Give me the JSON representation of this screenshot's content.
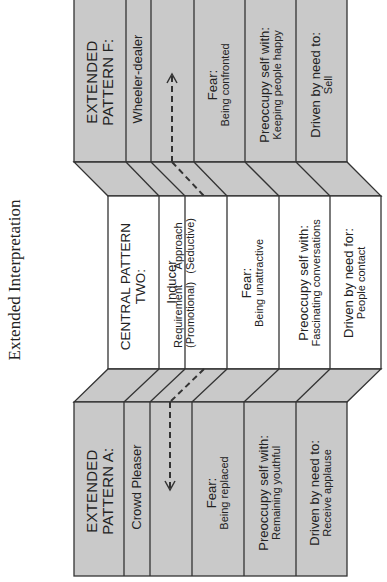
{
  "title": "Extended Interpretation",
  "colors": {
    "gray_fill": "#c9c9c9",
    "center_fill": "#ffffff",
    "line": "#333333"
  },
  "top_pattern": {
    "header": "EXTENDED\nPATTERN F:",
    "header_l1": "EXTENDED",
    "header_l2": "PATTERN F:",
    "name": "Wheeler-dealer",
    "arrow": "dashed-arrow-up",
    "fear_label": "Fear:",
    "fear": "Being confronted",
    "preoccupy_label": "Preoccupy self with:",
    "preoccupy": "Keeping people happy",
    "driven_label": "Driven by need to:",
    "driven": "Sell"
  },
  "center_pattern": {
    "header_l1": "CENTRAL PATTERN",
    "header_l2": "TWO:",
    "name": "Inducer",
    "requirement_label": "Requirement",
    "requirement": "(Promotional)",
    "approach_label": "Approach",
    "approach": "(Seductive)",
    "fear_label": "Fear:",
    "fear": "Being unattractive",
    "preoccupy_label": "Preoccupy self with:",
    "preoccupy": "Fascinating conversations",
    "driven_label": "Driven by need for:",
    "driven": "People contact"
  },
  "bottom_pattern": {
    "header_l1": "EXTENDED",
    "header_l2": "PATTERN  A:",
    "name": "Crowd Pleaser",
    "arrow": "dashed-arrow-down",
    "fear_label": "Fear:",
    "fear": "Being replaced",
    "preoccupy_label": "Preoccupy self with:",
    "preoccupy": "Remaining youthful",
    "driven_label": "Driven by need to:",
    "driven": "Receive applause"
  }
}
